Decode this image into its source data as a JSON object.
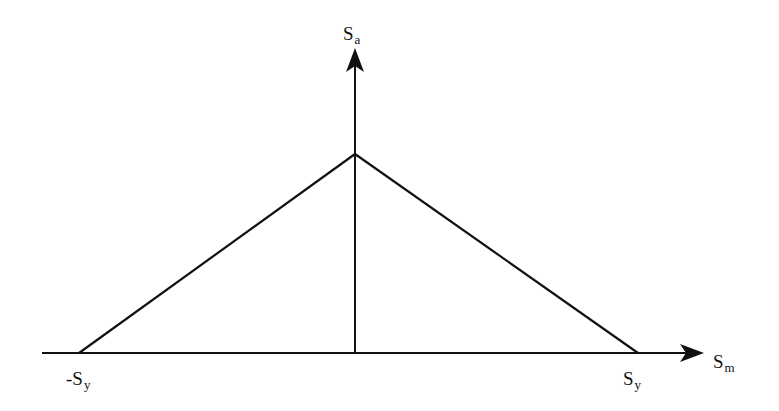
{
  "diagram": {
    "type": "stress-failure-envelope",
    "axes": {
      "x": {
        "label": {
          "base": "S",
          "sub": "m"
        },
        "tick_labels": [
          {
            "id": "neg_sy",
            "base": "-S",
            "sub": "y"
          },
          {
            "id": "pos_sy",
            "base": "S",
            "sub": "y"
          }
        ]
      },
      "y": {
        "label": {
          "base": "S",
          "sub": "a"
        }
      }
    },
    "envelope": {
      "vertices": [
        {
          "name": "-Sy",
          "x": 79,
          "y": 353
        },
        {
          "name": "peak",
          "x": 355,
          "y": 154
        },
        {
          "name": "Sy",
          "x": 638,
          "y": 353
        }
      ]
    },
    "colors": {
      "line": "#111111",
      "background": "#ffffff"
    }
  }
}
